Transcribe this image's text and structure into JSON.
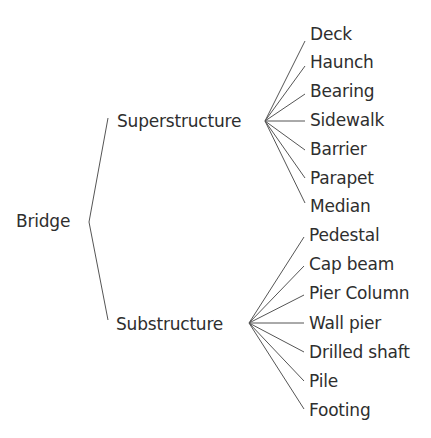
{
  "diagram": {
    "type": "tree",
    "root": {
      "label": "Bridge",
      "children": [
        {
          "label": "Superstructure",
          "children": [
            "Deck",
            "Haunch",
            "Bearing",
            "Sidewalk",
            "Barrier",
            "Parapet",
            "Median"
          ]
        },
        {
          "label": "Substructure",
          "children": [
            "Pedestal",
            "Cap beam",
            "Pier Column",
            "Wall pier",
            "Drilled shaft",
            "Pile",
            "Footing"
          ]
        }
      ]
    },
    "line_color": "#555555",
    "text_color": "#2e2e2e",
    "background": "#ffffff"
  }
}
